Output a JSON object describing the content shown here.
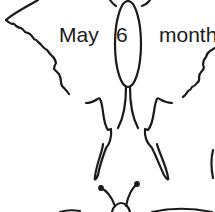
{
  "illustration": {
    "subject": "butterfly line drawing",
    "stroke_color": "#1a1a1a",
    "background_color": "#ffffff"
  },
  "labels": {
    "month_name": "May",
    "day_number": "6",
    "month_word": "month"
  }
}
